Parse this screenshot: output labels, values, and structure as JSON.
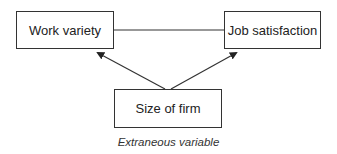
{
  "nodes": {
    "work_variety": {
      "label": "Work variety"
    },
    "job_satisfaction": {
      "label": "Job satisfaction"
    },
    "size_of_firm": {
      "label": "Size of firm"
    }
  },
  "edges": [
    {
      "from": "work_variety",
      "to": "job_satisfaction",
      "type": "line"
    },
    {
      "from": "size_of_firm",
      "to": "work_variety",
      "type": "arrow"
    },
    {
      "from": "size_of_firm",
      "to": "job_satisfaction",
      "type": "arrow"
    }
  ],
  "caption": "Extraneous variable"
}
